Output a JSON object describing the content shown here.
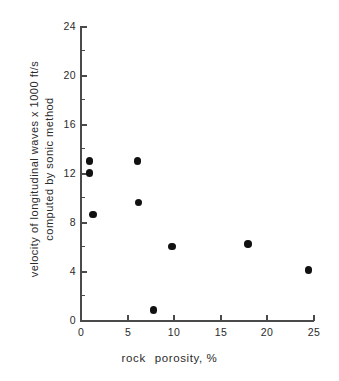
{
  "chart_data": {
    "type": "scatter",
    "title": "",
    "xlabel": "rock   porosity, %",
    "ylabel_line1": "velocity of longitudinal waves x 1000 ft/s",
    "ylabel_line2": "computed by sonic method",
    "xlim": [
      0,
      25
    ],
    "ylim": [
      0,
      24
    ],
    "xticks": [
      0,
      5,
      10,
      15,
      20,
      25
    ],
    "xtick_labels": [
      "0",
      "5",
      "10",
      "15",
      "20",
      "25"
    ],
    "yticks": [
      0,
      4,
      8,
      12,
      16,
      20,
      24
    ],
    "ytick_labels": [
      "0",
      "4",
      "8",
      "12",
      "16",
      "20",
      "24"
    ],
    "minor_yticks": [
      2,
      6,
      10,
      14,
      18,
      22
    ],
    "grid": false,
    "legend": null,
    "marker": "filled-circle",
    "marker_color": "#111111",
    "points": [
      {
        "x": 0.9,
        "y": 13.0
      },
      {
        "x": 0.9,
        "y": 12.0
      },
      {
        "x": 1.3,
        "y": 8.6
      },
      {
        "x": 6.1,
        "y": 13.0
      },
      {
        "x": 6.2,
        "y": 9.6
      },
      {
        "x": 7.8,
        "y": 0.8
      },
      {
        "x": 9.8,
        "y": 6.0
      },
      {
        "x": 18.0,
        "y": 6.2
      },
      {
        "x": 24.5,
        "y": 4.1
      }
    ],
    "series": [
      {
        "name": "rock samples",
        "x": [
          0.9,
          0.9,
          1.3,
          6.1,
          6.2,
          7.8,
          9.8,
          18.0,
          24.5
        ],
        "values": [
          13.0,
          12.0,
          8.6,
          13.0,
          9.6,
          0.8,
          6.0,
          6.2,
          4.1
        ]
      }
    ]
  },
  "xlabel_parts": {
    "part1": "rock",
    "part2": "porosity, %"
  }
}
